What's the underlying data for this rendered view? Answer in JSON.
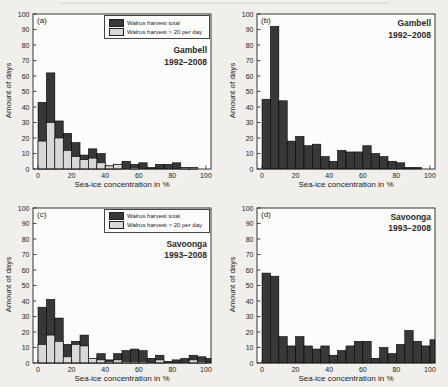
{
  "figure": {
    "page_bg": "#f0efec",
    "plot_bg": "#fcfcfa",
    "frame_color": "#222222",
    "xlabel": "Sea-ice concentration in %",
    "ylabel": "Amount of days"
  },
  "legend": {
    "items": [
      {
        "label": "Walrus harvest total",
        "color": "#383838"
      },
      {
        "label": "Walrus harvest > 20 per day",
        "color": "#d8d8d6"
      }
    ]
  },
  "chart_data": [
    {
      "type": "bar",
      "panel": "(a)",
      "title": "Gambell",
      "years": "1992−2008",
      "xlabel": "Sea-ice concentration in %",
      "ylabel": "Amount of days",
      "xlim": [
        -3,
        103
      ],
      "ylim": [
        0,
        100
      ],
      "xticks": [
        0,
        20,
        40,
        60,
        80,
        100
      ],
      "yticks": [
        0,
        10,
        20,
        30,
        40,
        50,
        60,
        70,
        80,
        90,
        100
      ],
      "bin_width": 5,
      "bin_starts": [
        0,
        5,
        10,
        15,
        20,
        25,
        30,
        35,
        40,
        45,
        50,
        55,
        60,
        65,
        70,
        75,
        80,
        85,
        90,
        95,
        100
      ],
      "series": [
        {
          "name": "Walrus harvest total",
          "color": "#383838",
          "values": [
            43,
            62,
            31,
            23,
            17,
            9,
            13,
            10,
            2,
            3,
            5,
            3,
            4,
            1,
            3,
            3,
            4,
            1,
            1,
            0,
            0
          ]
        },
        {
          "name": "Walrus harvest > 20 per day",
          "color": "#d8d8d6",
          "values": [
            18,
            30,
            20,
            12,
            8,
            6,
            7,
            4,
            2,
            3,
            0,
            1,
            0,
            0,
            0,
            0,
            0,
            1,
            1,
            0,
            0
          ]
        }
      ],
      "has_legend": true
    },
    {
      "type": "bar",
      "panel": "(b)",
      "title": "Gambell",
      "years": "1992−2008",
      "xlabel": "Sea-ice concentration in %",
      "ylabel": "Amount of days",
      "xlim": [
        -3,
        103
      ],
      "ylim": [
        0,
        100
      ],
      "xticks": [
        0,
        20,
        40,
        60,
        80,
        100
      ],
      "yticks": [
        0,
        10,
        20,
        30,
        40,
        50,
        60,
        70,
        80,
        90,
        100
      ],
      "bin_width": 5,
      "bin_starts": [
        0,
        5,
        10,
        15,
        20,
        25,
        30,
        35,
        40,
        45,
        50,
        55,
        60,
        65,
        70,
        75,
        80,
        85,
        90,
        95,
        100
      ],
      "series": [
        {
          "name": "Walrus harvest total",
          "color": "#383838",
          "values": [
            45,
            92,
            44,
            18,
            21,
            15,
            16,
            8,
            5,
            12,
            11,
            11,
            15,
            10,
            8,
            5,
            4,
            1,
            1,
            0,
            0
          ]
        }
      ],
      "has_legend": false
    },
    {
      "type": "bar",
      "panel": "(c)",
      "title": "Savoonga",
      "years": "1993−2008",
      "xlabel": "Sea-ice concentration in %",
      "ylabel": "Amount of days",
      "xlim": [
        -3,
        103
      ],
      "ylim": [
        0,
        100
      ],
      "xticks": [
        0,
        20,
        40,
        60,
        80,
        100
      ],
      "yticks": [
        0,
        10,
        20,
        30,
        40,
        50,
        60,
        70,
        80,
        90,
        100
      ],
      "bin_width": 5,
      "bin_starts": [
        0,
        5,
        10,
        15,
        20,
        25,
        30,
        35,
        40,
        45,
        50,
        55,
        60,
        65,
        70,
        75,
        80,
        85,
        90,
        95,
        100
      ],
      "series": [
        {
          "name": "Walrus harvest total",
          "color": "#383838",
          "values": [
            36,
            41,
            29,
            12,
            14,
            18,
            3,
            6,
            2,
            6,
            8,
            9,
            8,
            3,
            5,
            1,
            2,
            3,
            5,
            4,
            3
          ]
        },
        {
          "name": "Walrus harvest > 20 per day",
          "color": "#d8d8d6",
          "values": [
            12,
            18,
            14,
            4,
            12,
            11,
            3,
            2,
            1,
            2,
            1,
            1,
            1,
            0,
            2,
            0,
            0,
            0,
            2,
            1,
            0
          ]
        }
      ],
      "has_legend": true
    },
    {
      "type": "bar",
      "panel": "(d)",
      "title": "Savoonga",
      "years": "1993−2008",
      "xlabel": "Sea-ice concentration in %",
      "ylabel": "Amount of days",
      "xlim": [
        -3,
        103
      ],
      "ylim": [
        0,
        100
      ],
      "xticks": [
        0,
        20,
        40,
        60,
        80,
        100
      ],
      "yticks": [
        0,
        10,
        20,
        30,
        40,
        50,
        60,
        70,
        80,
        90,
        100
      ],
      "bin_width": 5,
      "bin_starts": [
        0,
        5,
        10,
        15,
        20,
        25,
        30,
        35,
        40,
        45,
        50,
        55,
        60,
        65,
        70,
        75,
        80,
        85,
        90,
        95,
        100
      ],
      "series": [
        {
          "name": "Walrus harvest total",
          "color": "#383838",
          "values": [
            58,
            56,
            17,
            11,
            17,
            11,
            9,
            11,
            5,
            8,
            11,
            14,
            14,
            3,
            10,
            6,
            12,
            21,
            14,
            11,
            15
          ]
        }
      ],
      "has_legend": false
    }
  ]
}
